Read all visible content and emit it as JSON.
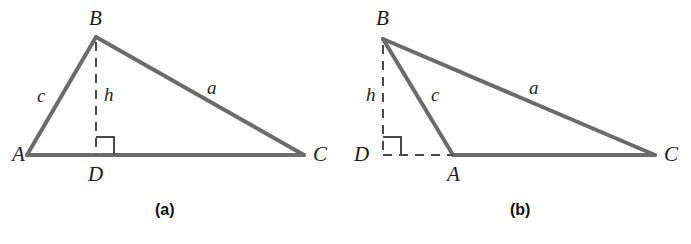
{
  "figure": {
    "kind": "geometry-diagram",
    "stroke_color": "#6b6b6b",
    "dash_color": "#4a4a4a",
    "text_color": "#1a1a1a",
    "background_color": "#ffffff",
    "stroke_width": 4,
    "dash_width": 2
  },
  "panels": [
    {
      "id": "a",
      "caption": "(a)",
      "caption_note": "acute triangle, foot D lies between A and C",
      "vertices": [
        {
          "name": "A",
          "label": "A",
          "x": 27,
          "y": 155
        },
        {
          "name": "B",
          "label": "B",
          "x": 96,
          "y": 37
        },
        {
          "name": "C",
          "label": "C",
          "x": 304,
          "y": 155
        },
        {
          "name": "D",
          "label": "D",
          "x": 96,
          "y": 155
        }
      ],
      "sides": [
        {
          "name": "c",
          "label": "c",
          "from": "A",
          "to": "B"
        },
        {
          "name": "a",
          "label": "a",
          "from": "B",
          "to": "C"
        },
        {
          "name": "b",
          "label": "",
          "from": "A",
          "to": "C"
        }
      ],
      "altitude": {
        "name": "h",
        "label": "h",
        "from": "B",
        "to": "D",
        "style": "dashed"
      },
      "right_angle": {
        "at": "D",
        "size": 18,
        "opens": "upper-right"
      }
    },
    {
      "id": "b",
      "caption": "(b)",
      "caption_note": "obtuse triangle, foot D lies outside segment AC beyond A",
      "vertices": [
        {
          "name": "B",
          "label": "B",
          "x": 38,
          "y": 39
        },
        {
          "name": "D",
          "label": "D",
          "x": 38,
          "y": 155
        },
        {
          "name": "A",
          "label": "A",
          "x": 108,
          "y": 155
        },
        {
          "name": "C",
          "label": "C",
          "x": 310,
          "y": 155
        }
      ],
      "sides": [
        {
          "name": "c",
          "label": "c",
          "from": "A",
          "to": "B"
        },
        {
          "name": "a",
          "label": "a",
          "from": "B",
          "to": "C"
        },
        {
          "name": "b",
          "label": "",
          "from": "A",
          "to": "C"
        }
      ],
      "altitude": {
        "name": "h",
        "label": "h",
        "from": "B",
        "to": "D",
        "style": "dashed"
      },
      "extension": {
        "from": "D",
        "to": "A",
        "style": "dashed"
      },
      "right_angle": {
        "at": "D",
        "size": 18,
        "opens": "upper-right"
      }
    }
  ]
}
